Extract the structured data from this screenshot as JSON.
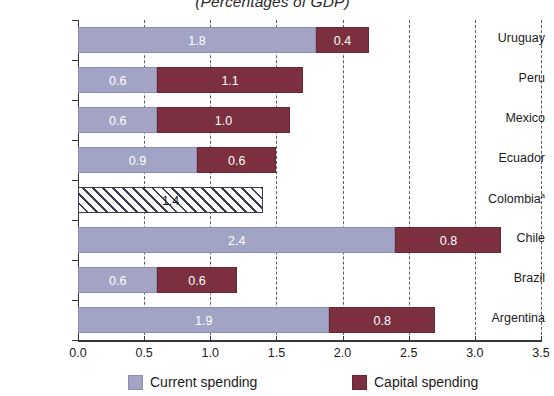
{
  "chart_data": {
    "type": "bar",
    "orientation": "horizontal",
    "stacked": true,
    "title": "(Percentages of GDP)",
    "xlabel": "",
    "ylabel": "",
    "xlim": [
      0.0,
      3.5
    ],
    "xticks": [
      "0.0",
      "0.5",
      "1.0",
      "1.5",
      "2.0",
      "2.5",
      "3.0",
      "3.5"
    ],
    "xtick_values": [
      0.0,
      0.5,
      1.0,
      1.5,
      2.0,
      2.5,
      3.0,
      3.5
    ],
    "grid": "vertical dashed at every 0.5",
    "legend_position": "bottom",
    "categories": [
      "Uruguay",
      "Peru",
      "Mexico",
      "Ecuador",
      "Colombia",
      "Chile",
      "Brazil",
      "Argentina"
    ],
    "category_footnotes": {
      "Colombia": "a"
    },
    "series": [
      {
        "name": "Current spending",
        "color": "#a3a3c6",
        "values": [
          1.8,
          0.6,
          0.6,
          0.9,
          1.4,
          2.4,
          0.6,
          1.9
        ],
        "labels": [
          "1.8",
          "0.6",
          "0.6",
          "0.9",
          "1.4",
          "2.4",
          "0.6",
          "1.9"
        ]
      },
      {
        "name": "Capital spending",
        "color": "#7c2f3e",
        "values": [
          0.4,
          1.1,
          1.0,
          0.6,
          null,
          0.8,
          0.6,
          0.8
        ],
        "labels": [
          "0.4",
          "1.1",
          "1.0",
          "0.6",
          "",
          "0.8",
          "0.6",
          "0.8"
        ]
      }
    ],
    "totals": [
      2.2,
      1.7,
      1.6,
      1.5,
      1.4,
      3.2,
      1.2,
      2.7
    ],
    "special_styles": {
      "Colombia": "hatched-outline (diagonal stripes, no fill, single combined bar)"
    }
  },
  "legend": {
    "items": [
      {
        "label": "Current spending",
        "color": "#a3a3c6",
        "style": "solid"
      },
      {
        "label": "Capital spending",
        "color": "#7c2f3e",
        "style": "solid"
      }
    ]
  }
}
